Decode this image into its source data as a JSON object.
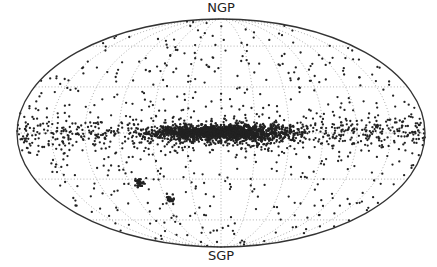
{
  "chart_data": {
    "type": "scatter",
    "projection": "mollweide",
    "title": "",
    "annotations": [
      {
        "text": "NGP",
        "position": "top",
        "meaning": "North Galactic Pole"
      },
      {
        "text": "SGP",
        "position": "bottom",
        "meaning": "South Galactic Pole"
      }
    ],
    "grid": true,
    "grid_style": "dotted",
    "graticule": {
      "meridians_deg": [
        -150,
        -120,
        -90,
        -60,
        -30,
        0,
        30,
        60,
        90,
        120,
        150
      ],
      "parallels_deg": [
        -60,
        -30,
        0,
        30,
        60
      ]
    },
    "features": [
      {
        "name": "galactic-plane-band",
        "l_range_deg": [
          -60,
          60
        ],
        "b_range_deg": [
          -6,
          6
        ],
        "density": "very high"
      },
      {
        "name": "lmc-cluster",
        "approx_l_deg": 80,
        "approx_b_deg": -33
      },
      {
        "name": "smc-cluster",
        "approx_l_deg": 55,
        "approx_b_deg": -44
      }
    ],
    "point_color": "#222222",
    "ellipse": {
      "cx": 221,
      "cy": 133,
      "rx": 204,
      "ry": 114
    }
  },
  "labels": {
    "top": "NGP",
    "bottom": "SGP"
  }
}
